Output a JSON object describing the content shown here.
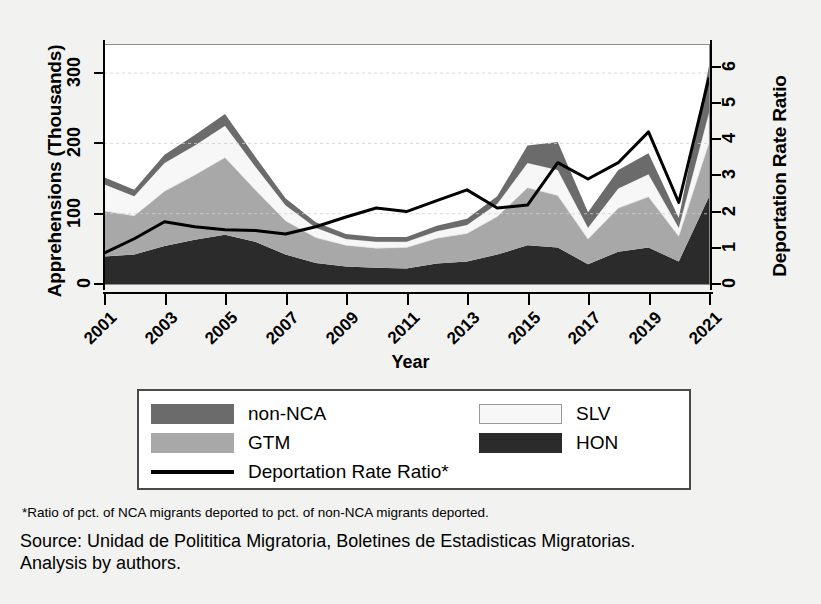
{
  "chart_data": {
    "type": "area",
    "title": "",
    "xlabel": "Year",
    "ylabel": "Apprehensions (Thousands)",
    "ylabel_right": "Deportation Rate Ratio",
    "grid": true,
    "legend_position": "bottom",
    "stacked": true,
    "x": [
      2001,
      2002,
      2003,
      2004,
      2005,
      2006,
      2007,
      2008,
      2009,
      2010,
      2011,
      2012,
      2013,
      2014,
      2015,
      2016,
      2017,
      2018,
      2019,
      2020,
      2021
    ],
    "xtick_labels": [
      "2001",
      "2003",
      "2005",
      "2007",
      "2009",
      "2011",
      "2013",
      "2015",
      "2017",
      "2019",
      "2021"
    ],
    "xtick_values": [
      2001,
      2003,
      2005,
      2007,
      2009,
      2011,
      2013,
      2015,
      2017,
      2019,
      2021
    ],
    "xlim": [
      2001,
      2021
    ],
    "ylim": [
      0,
      340
    ],
    "ytick_values": [
      0,
      100,
      200,
      300
    ],
    "ytick_labels": [
      "0",
      "100",
      "200",
      "300"
    ],
    "ylim_right": [
      0,
      6.6
    ],
    "ytick_values_right": [
      0,
      1,
      2,
      3,
      4,
      5,
      6
    ],
    "ytick_labels_right": [
      "0",
      "1",
      "2",
      "3",
      "4",
      "5",
      "6"
    ],
    "series": [
      {
        "name": "HON",
        "label": "HON",
        "color": "#2b2b2b",
        "order": 1,
        "values": [
          39,
          42,
          54,
          63,
          70,
          60,
          42,
          30,
          25,
          23,
          22,
          29,
          32,
          42,
          55,
          52,
          28,
          46,
          52,
          32,
          124
        ]
      },
      {
        "name": "GTM",
        "label": "GTM",
        "color": "#a8a8a8",
        "order": 2,
        "values": [
          65,
          55,
          78,
          92,
          110,
          74,
          48,
          36,
          30,
          28,
          30,
          36,
          40,
          54,
          82,
          74,
          36,
          62,
          72,
          36,
          77
        ]
      },
      {
        "name": "SLV",
        "label": "SLV",
        "color": "#f7f7f7",
        "order": 3,
        "values": [
          38,
          28,
          40,
          42,
          45,
          33,
          22,
          14,
          9,
          9,
          8,
          10,
          12,
          18,
          35,
          36,
          16,
          28,
          32,
          12,
          43
        ]
      },
      {
        "name": "non-NCA",
        "label": "non-NCA",
        "color": "#6b6b6b",
        "order": 4,
        "values": [
          10,
          9,
          12,
          15,
          17,
          14,
          10,
          8,
          7,
          7,
          7,
          8,
          9,
          11,
          25,
          40,
          22,
          26,
          30,
          14,
          66
        ]
      }
    ],
    "line_series": {
      "name": "Deportation Rate Ratio",
      "label": "Deportation Rate Ratio*",
      "color": "#000000",
      "axis": "right",
      "values": [
        0.85,
        1.25,
        1.72,
        1.58,
        1.5,
        1.48,
        1.38,
        1.58,
        1.85,
        2.1,
        2.0,
        2.3,
        2.6,
        2.1,
        2.18,
        3.35,
        3.52,
        2.9,
        3.35,
        4.2,
        2.25,
        5.7
      ],
      "x_values": [
        2001,
        2002,
        2003,
        2004,
        2005,
        2006,
        2007,
        2008,
        2009,
        2010,
        2011,
        2012,
        2013,
        2014,
        2015,
        2016,
        2017,
        2018,
        2019,
        2020,
        2021
      ],
      "series_values": [
        0.85,
        1.25,
        1.72,
        1.58,
        1.5,
        1.48,
        1.38,
        1.58,
        1.85,
        2.1,
        2.0,
        2.3,
        2.6,
        2.1,
        2.18,
        3.35,
        2.9,
        3.35,
        4.2,
        2.25,
        5.7
      ]
    }
  },
  "legend": {
    "items_left": [
      {
        "label": "non-NCA",
        "color": "#6b6b6b",
        "kind": "swatch"
      },
      {
        "label": "GTM",
        "color": "#a8a8a8",
        "kind": "swatch"
      },
      {
        "label": "Deportation Rate Ratio*",
        "color": "#000000",
        "kind": "line"
      }
    ],
    "items_right": [
      {
        "label": "SLV",
        "color": "#f7f7f7",
        "kind": "swatch"
      },
      {
        "label": "HON",
        "color": "#2b2b2b",
        "kind": "swatch"
      }
    ]
  },
  "notes": {
    "footnote": "*Ratio of pct. of NCA migrants deported to pct. of non-NCA migrants deported.",
    "source_line1": "Source: Unidad de Polititica Migratoria, Boletines de Estadisticas Migratorias.",
    "source_line2": "Analysis by authors."
  }
}
